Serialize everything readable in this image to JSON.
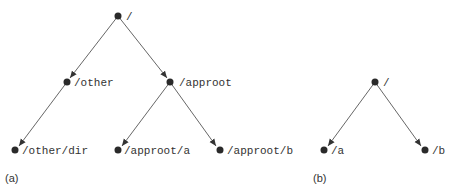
{
  "diagrams": [
    {
      "caption": "(a)",
      "nodes": [
        {
          "id": "root",
          "label": "/",
          "x": 118,
          "y": 16
        },
        {
          "id": "other",
          "label": "/other",
          "x": 67,
          "y": 82
        },
        {
          "id": "approot",
          "label": "/approot",
          "x": 170,
          "y": 82
        },
        {
          "id": "other_dir",
          "label": "/other/dir",
          "x": 15,
          "y": 150
        },
        {
          "id": "approot_a",
          "label": "/approot/a",
          "x": 118,
          "y": 150
        },
        {
          "id": "approot_b",
          "label": "/approot/b",
          "x": 220,
          "y": 150
        }
      ],
      "edges": [
        [
          "root",
          "other"
        ],
        [
          "root",
          "approot"
        ],
        [
          "other",
          "other_dir"
        ],
        [
          "approot",
          "approot_a"
        ],
        [
          "approot",
          "approot_b"
        ]
      ]
    },
    {
      "caption": "(b)",
      "nodes": [
        {
          "id": "root",
          "label": "/",
          "x": 375,
          "y": 82
        },
        {
          "id": "a",
          "label": "/a",
          "x": 324,
          "y": 150
        },
        {
          "id": "b",
          "label": "/b",
          "x": 425,
          "y": 150
        }
      ],
      "edges": [
        [
          "root",
          "a"
        ],
        [
          "root",
          "b"
        ]
      ]
    }
  ]
}
